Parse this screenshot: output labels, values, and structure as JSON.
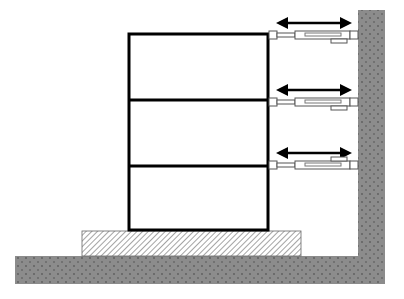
{
  "diagram": {
    "colors": {
      "ground": "#8c8c8c",
      "building_outline": "#000000",
      "base_hatch": "#555555",
      "actuator": "#ffffff",
      "arrow": "#000000"
    },
    "building": {
      "stories": 3
    },
    "actuators": [
      {
        "level": 1,
        "tab_position": "below"
      },
      {
        "level": 2,
        "tab_position": "below"
      },
      {
        "level": 3,
        "tab_position": "above"
      }
    ]
  }
}
